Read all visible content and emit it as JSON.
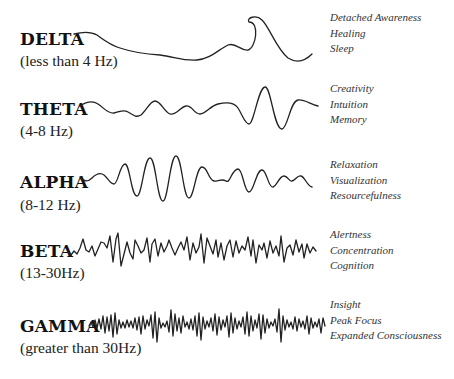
{
  "stroke_color": "#222222",
  "bands": [
    {
      "name": "DELTA",
      "range": "(less than 4 Hz)",
      "states": [
        "Detached Awareness",
        "Healing",
        "Sleep"
      ]
    },
    {
      "name": "THETA",
      "range": "(4-8 Hz)",
      "states": [
        "Creativity",
        "Intuition",
        "Memory"
      ]
    },
    {
      "name": "ALPHA",
      "range": "(8-12 Hz)",
      "states": [
        "Relaxation",
        "Visualization",
        "Resourcefulness"
      ]
    },
    {
      "name": "BETA",
      "range": "(13-30Hz)",
      "states": [
        "Alertness",
        "Concentration",
        "Cognition"
      ]
    },
    {
      "name": "GAMMA",
      "range": "(greater than 30Hz)",
      "states": [
        "Insight",
        "Peak Focus",
        "Expanded Consciousness"
      ]
    }
  ]
}
